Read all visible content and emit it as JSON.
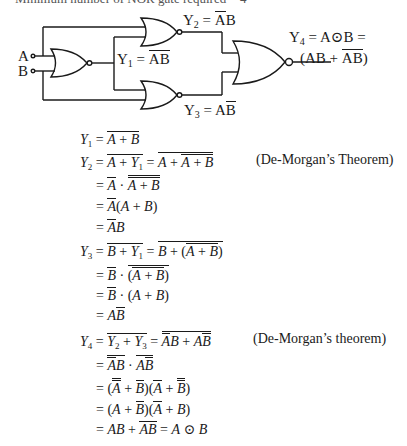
{
  "header": {
    "note": "Minimum number of NOR gate required = 4"
  },
  "circuit": {
    "inputs": [
      "A",
      "B"
    ],
    "gates": [
      {
        "id": "G1",
        "type": "NOR",
        "inputs": [
          "A",
          "B"
        ],
        "output": "Y1"
      },
      {
        "id": "G2",
        "type": "NOR",
        "inputs": [
          "A",
          "Y1"
        ],
        "output": "Y2"
      },
      {
        "id": "G3",
        "type": "NOR",
        "inputs": [
          "Y1",
          "B"
        ],
        "output": "Y3"
      },
      {
        "id": "G4",
        "type": "NOR",
        "inputs": [
          "Y2",
          "Y3"
        ],
        "output": "Y4"
      }
    ],
    "labels": {
      "input_a": "A",
      "input_b": "B",
      "y1_lhs": "Y",
      "y1_sub": "1",
      "y1_rhs": "AB",
      "y2_lhs": "Y",
      "y2_sub": "2",
      "y2_rhs_a": "A",
      "y2_rhs_b": "B",
      "y3_lhs": "Y",
      "y3_sub": "3",
      "y3_rhs_a": "A",
      "y3_rhs_b": "B",
      "y4_line1_lhs": "Y",
      "y4_sub": "4",
      "y4_line1_rhs": "= A⊙B =",
      "y4_line2": "(AB + AB)"
    }
  },
  "derivation": {
    "y1": {
      "lhs": "Y",
      "sub": "1",
      "expr": "A + B"
    },
    "y2": {
      "lhs": "Y",
      "sub": "2",
      "steps": [
        "A + Y1",
        "A + A + B",
        "A · A + B",
        "A(A + B)",
        "AB"
      ],
      "note": "(De-Morgan’s Theorem)"
    },
    "y3": {
      "lhs": "Y",
      "sub": "3",
      "steps": [
        "B + Y1",
        "B + (A + B)",
        "B · (A + B)",
        "B · (A + B)",
        "AB"
      ]
    },
    "y4": {
      "lhs": "Y",
      "sub": "4",
      "steps": [
        "Y2 + Y3",
        "AB + AB",
        "AB · AB",
        "(A + B)(A + B)",
        "(A + B)(A + B)",
        "AB + AB = A ⊙ B"
      ],
      "note": "(De-Morgan’s theorem)"
    },
    "symbols": {
      "eq": "=",
      "plus": "+",
      "dot": "·",
      "xnor": "⊙",
      "A": "A",
      "B": "B",
      "lp": "(",
      "rp": ")"
    }
  }
}
